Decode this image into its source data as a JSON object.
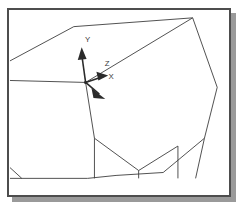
{
  "viewport": {
    "title": "3D Wireframe Viewport",
    "background_color": "#ffffff",
    "frame_color": "#4d4d4d",
    "shadow_color": "#9a9a9a",
    "wireframe_color": "#3a3a3a",
    "triad_color": "#2b2b2b"
  },
  "axis_triad": {
    "origin_label": "",
    "axes": [
      {
        "name": "y-axis",
        "label": "Y",
        "label_x": 94,
        "label_y": 39
      },
      {
        "name": "z-axis",
        "label": "Z",
        "label_x": 110,
        "label_y": 62
      },
      {
        "name": "x-axis",
        "label": "X",
        "label_x": 113,
        "label_y": 74
      }
    ]
  },
  "model": {
    "name": "faceted-solid",
    "description": "Wireframe polyhedron outline",
    "outline_points": "8,58 72,23 193,14 218,85 205,137 163,172 115,175 86,178 8,178",
    "edges": [
      {
        "name": "edge-apex-to-origin",
        "points": "193,14 84,80"
      },
      {
        "name": "edge-origin-to-left",
        "points": "84,80 8,78"
      },
      {
        "name": "edge-origin-down",
        "points": "84,80 93,137"
      },
      {
        "name": "edge-lower-left-vert",
        "points": "93,137 93,178"
      },
      {
        "name": "edge-valley-left",
        "points": "93,137 138,170"
      },
      {
        "name": "edge-valley-right",
        "points": "138,170 178,145"
      },
      {
        "name": "edge-valley-vert",
        "points": "138,170 138,178"
      },
      {
        "name": "edge-right-vert",
        "points": "178,145 178,178"
      },
      {
        "name": "edge-right-lower",
        "points": "205,137 196,178"
      },
      {
        "name": "edge-bottom-left-notch",
        "points": "8,167 20,178"
      }
    ]
  }
}
